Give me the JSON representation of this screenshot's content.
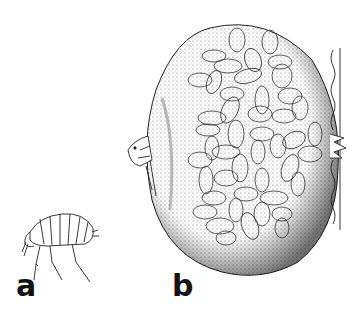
{
  "figure": {
    "panels": [
      {
        "id": "a",
        "label": "a",
        "subject": "flea, lateral view"
      },
      {
        "id": "b",
        "label": "b",
        "subject": "engorged female flea embedded in host skin, eggs visible through abdomen"
      }
    ],
    "colors": {
      "ink": "#111111",
      "stipple": "#555555",
      "background": "#ffffff"
    }
  }
}
